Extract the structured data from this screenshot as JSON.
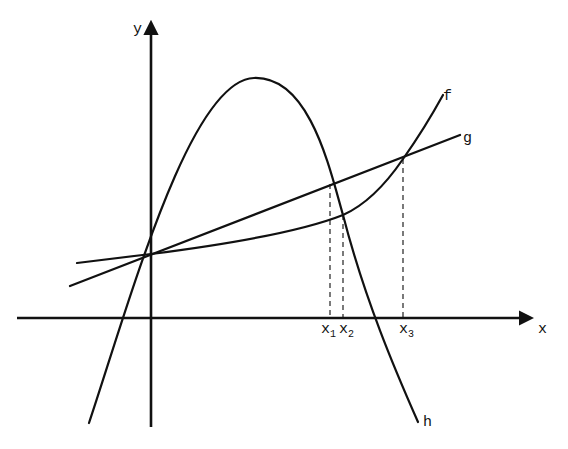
{
  "diagram": {
    "axes": {
      "x_label": "x",
      "y_label": "y",
      "origin_px": [
        151,
        318
      ],
      "x_axis_px": {
        "from": 17,
        "to": 530,
        "y": 318
      },
      "y_axis_px": {
        "x": 151,
        "from": 427,
        "to": 22
      }
    },
    "curves": [
      {
        "name": "f",
        "label": "f",
        "description": "slowly increasing convex curve, rising steeply on the right"
      },
      {
        "name": "g",
        "label": "g",
        "description": "straight line with positive slope"
      },
      {
        "name": "h",
        "label": "h",
        "description": "downward-opening parabola"
      }
    ],
    "intersections": [
      {
        "label": "x",
        "subscript": "1",
        "curves": [
          "g",
          "h"
        ],
        "px": [
          330,
          184
        ]
      },
      {
        "label": "x",
        "subscript": "2",
        "curves": [
          "f",
          "h"
        ],
        "px": [
          343,
          215
        ]
      },
      {
        "label": "x",
        "subscript": "3",
        "curves": [
          "f",
          "g"
        ],
        "px": [
          403,
          159
        ]
      }
    ],
    "common_point": {
      "description": "f, g and h all meet on the y-axis",
      "px": [
        151,
        254
      ]
    },
    "h_vertex_px": [
      254,
      78
    ],
    "colors": {
      "stroke": "#111111",
      "background": "#ffffff"
    }
  }
}
